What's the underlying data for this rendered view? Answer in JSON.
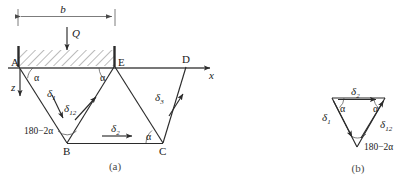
{
  "figure": {
    "title_a": "(a)",
    "title_b": "(b)",
    "background": "#ffffff",
    "line_color": "#2b2b2b",
    "axis_color": "#4a4a4a"
  },
  "panel_a": {
    "caption": "(a)",
    "nodes": [
      {
        "id": "A",
        "label": "A",
        "x": 18,
        "y": 68
      },
      {
        "id": "E",
        "label": "E",
        "x": 115,
        "y": 68
      },
      {
        "id": "D",
        "label": "D",
        "x": 185,
        "y": 68
      },
      {
        "id": "B",
        "label": "B",
        "x": 67,
        "y": 143
      },
      {
        "id": "C",
        "label": "C",
        "x": 163,
        "y": 143
      }
    ],
    "dimension": {
      "label": "b",
      "from_x": 18,
      "to_x": 115,
      "y": 16
    },
    "load": {
      "label": "Q",
      "x": 67,
      "from_y": 27,
      "to_y": 52
    },
    "axes": [
      {
        "label": "x",
        "direction": "right",
        "from_x": 18,
        "to_x": 214,
        "y": 68
      },
      {
        "label": "z",
        "direction": "down",
        "x": 20,
        "from_y": 70,
        "to_y": 95
      }
    ],
    "angles": [
      {
        "label": "α",
        "at": "A",
        "x": 30,
        "y": 79
      },
      {
        "label": "α",
        "at": "E",
        "x": 104,
        "y": 79
      },
      {
        "label": "α",
        "at": "C",
        "x": 150,
        "y": 139
      },
      {
        "label": "180−2α",
        "at": "B",
        "x": 27,
        "y": 133
      }
    ],
    "displacements": [
      {
        "label": "δ",
        "sub": "1",
        "x": 50,
        "y": 101
      },
      {
        "label": "δ",
        "sub": "12",
        "x": 71,
        "y": 110
      },
      {
        "label": "δ",
        "sub": "2",
        "x": 115,
        "y": 131
      },
      {
        "label": "δ",
        "sub": "3",
        "x": 158,
        "y": 99
      }
    ],
    "support_hatch": {
      "from_x": 18,
      "to_x": 115,
      "top_y": 48,
      "bottom_y": 67
    }
  },
  "panel_b": {
    "caption": "(b)",
    "vertices": {
      "top_left": {
        "x": 332,
        "y": 98
      },
      "top_right": {
        "x": 385,
        "y": 98
      },
      "bottom": {
        "x": 356,
        "y": 146
      }
    },
    "angles": [
      {
        "label": "α",
        "x": 342,
        "y": 110
      },
      {
        "label": "α",
        "x": 373,
        "y": 110
      },
      {
        "label": "180−2α",
        "x": 360,
        "y": 147
      }
    ],
    "displacements": [
      {
        "label": "δ",
        "sub": "2",
        "x": 351,
        "y": 93
      },
      {
        "label": "δ",
        "sub": "1",
        "x": 325,
        "y": 118
      },
      {
        "label": "δ",
        "sub": "12",
        "x": 384,
        "y": 124
      }
    ]
  }
}
